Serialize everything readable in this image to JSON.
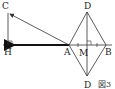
{
  "figure": {
    "caption": "図3",
    "points": {
      "C": {
        "label": "C"
      },
      "H": {
        "label": "H"
      },
      "A": {
        "label": "A"
      },
      "M": {
        "label": "M"
      },
      "B": {
        "label": "B"
      },
      "D_top": {
        "label": "D"
      },
      "D_bottom": {
        "label": "D"
      }
    }
  },
  "colors": {
    "line": "#333333",
    "arrow": "#111111"
  }
}
